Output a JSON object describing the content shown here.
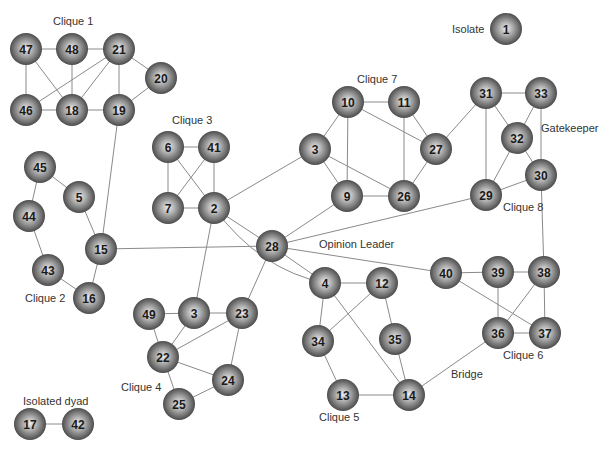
{
  "diagram": {
    "type": "social-network",
    "node_style": {
      "fill_light": "#e6e6e6",
      "fill_mid": "#8f8f8f",
      "fill_dark": "#3a3a3a",
      "edge_color": "#8a8a8a",
      "radius": 16
    },
    "nodes": [
      {
        "id": "47",
        "x": 26,
        "y": 49
      },
      {
        "id": "48",
        "x": 72,
        "y": 49
      },
      {
        "id": "21",
        "x": 119,
        "y": 49
      },
      {
        "id": "20",
        "x": 161,
        "y": 78
      },
      {
        "id": "46",
        "x": 26,
        "y": 110
      },
      {
        "id": "18",
        "x": 72,
        "y": 110
      },
      {
        "id": "19",
        "x": 119,
        "y": 110
      },
      {
        "id": "1",
        "x": 506,
        "y": 29
      },
      {
        "id": "10",
        "x": 348,
        "y": 102
      },
      {
        "id": "11",
        "x": 404,
        "y": 102
      },
      {
        "id": "3a",
        "label": "3",
        "x": 315,
        "y": 149
      },
      {
        "id": "27",
        "x": 436,
        "y": 149
      },
      {
        "id": "9",
        "x": 347,
        "y": 196
      },
      {
        "id": "26",
        "x": 404,
        "y": 196
      },
      {
        "id": "31",
        "x": 486,
        "y": 93
      },
      {
        "id": "33",
        "x": 541,
        "y": 93
      },
      {
        "id": "32",
        "x": 517,
        "y": 138
      },
      {
        "id": "30",
        "x": 541,
        "y": 175
      },
      {
        "id": "29",
        "x": 486,
        "y": 195
      },
      {
        "id": "6",
        "x": 168,
        "y": 147
      },
      {
        "id": "41",
        "x": 214,
        "y": 147
      },
      {
        "id": "7",
        "x": 168,
        "y": 208
      },
      {
        "id": "2",
        "x": 214,
        "y": 208
      },
      {
        "id": "45",
        "x": 40,
        "y": 167
      },
      {
        "id": "5",
        "x": 79,
        "y": 197
      },
      {
        "id": "44",
        "x": 29,
        "y": 216
      },
      {
        "id": "15",
        "x": 101,
        "y": 249
      },
      {
        "id": "43",
        "x": 48,
        "y": 270
      },
      {
        "id": "16",
        "x": 89,
        "y": 298
      },
      {
        "id": "28",
        "x": 272,
        "y": 246
      },
      {
        "id": "4",
        "x": 325,
        "y": 283
      },
      {
        "id": "12",
        "x": 382,
        "y": 283
      },
      {
        "id": "34",
        "x": 318,
        "y": 341
      },
      {
        "id": "35",
        "x": 395,
        "y": 339
      },
      {
        "id": "13",
        "x": 343,
        "y": 395
      },
      {
        "id": "14",
        "x": 409,
        "y": 395
      },
      {
        "id": "40",
        "x": 446,
        "y": 273
      },
      {
        "id": "39",
        "x": 498,
        "y": 272
      },
      {
        "id": "38",
        "x": 544,
        "y": 272
      },
      {
        "id": "36",
        "x": 498,
        "y": 333
      },
      {
        "id": "37",
        "x": 545,
        "y": 333
      },
      {
        "id": "49",
        "x": 149,
        "y": 314
      },
      {
        "id": "3b",
        "label": "3",
        "x": 194,
        "y": 313
      },
      {
        "id": "23",
        "x": 242,
        "y": 313
      },
      {
        "id": "22",
        "x": 163,
        "y": 357
      },
      {
        "id": "24",
        "x": 228,
        "y": 380
      },
      {
        "id": "25",
        "x": 179,
        "y": 404
      },
      {
        "id": "17",
        "x": 30,
        "y": 424
      },
      {
        "id": "42",
        "x": 78,
        "y": 424
      }
    ],
    "edges": [
      [
        "47",
        "48"
      ],
      [
        "48",
        "21"
      ],
      [
        "47",
        "46"
      ],
      [
        "47",
        "18"
      ],
      [
        "48",
        "18"
      ],
      [
        "21",
        "46"
      ],
      [
        "21",
        "18"
      ],
      [
        "21",
        "19"
      ],
      [
        "21",
        "20"
      ],
      [
        "20",
        "19"
      ],
      [
        "46",
        "18"
      ],
      [
        "18",
        "19"
      ],
      [
        "19",
        "15"
      ],
      [
        "10",
        "11"
      ],
      [
        "10",
        "3a"
      ],
      [
        "10",
        "9"
      ],
      [
        "10",
        "27"
      ],
      [
        "11",
        "27"
      ],
      [
        "11",
        "26"
      ],
      [
        "3a",
        "9"
      ],
      [
        "3a",
        "26"
      ],
      [
        "9",
        "26"
      ],
      [
        "26",
        "27"
      ],
      [
        "27",
        "31"
      ],
      [
        "31",
        "33"
      ],
      [
        "31",
        "32"
      ],
      [
        "31",
        "29"
      ],
      [
        "33",
        "32"
      ],
      [
        "33",
        "30"
      ],
      [
        "32",
        "29"
      ],
      [
        "32",
        "30"
      ],
      [
        "29",
        "30"
      ],
      [
        "6",
        "41"
      ],
      [
        "6",
        "7"
      ],
      [
        "6",
        "2"
      ],
      [
        "41",
        "7"
      ],
      [
        "41",
        "2"
      ],
      [
        "7",
        "2"
      ],
      [
        "2",
        "3a"
      ],
      [
        "2",
        "28"
      ],
      [
        "2",
        "3b"
      ],
      [
        "45",
        "5"
      ],
      [
        "45",
        "44"
      ],
      [
        "5",
        "15"
      ],
      [
        "44",
        "43"
      ],
      [
        "43",
        "16"
      ],
      [
        "15",
        "16"
      ],
      [
        "15",
        "28"
      ],
      [
        "28",
        "9"
      ],
      [
        "28",
        "29"
      ],
      [
        "28",
        "40"
      ],
      [
        "28",
        "4"
      ],
      [
        "28",
        "23"
      ],
      [
        "4",
        "12"
      ],
      [
        "4",
        "34"
      ],
      [
        "4",
        "14"
      ],
      [
        "12",
        "34"
      ],
      [
        "12",
        "35"
      ],
      [
        "34",
        "13"
      ],
      [
        "35",
        "14"
      ],
      [
        "13",
        "14"
      ],
      [
        "14",
        "36"
      ],
      [
        "40",
        "39"
      ],
      [
        "40",
        "37"
      ],
      [
        "39",
        "38"
      ],
      [
        "39",
        "36"
      ],
      [
        "38",
        "36"
      ],
      [
        "38",
        "37"
      ],
      [
        "36",
        "37"
      ],
      [
        "30",
        "38"
      ],
      [
        "49",
        "3b"
      ],
      [
        "3b",
        "23"
      ],
      [
        "49",
        "22"
      ],
      [
        "3b",
        "22"
      ],
      [
        "23",
        "22"
      ],
      [
        "23",
        "24"
      ],
      [
        "22",
        "24"
      ],
      [
        "22",
        "25"
      ],
      [
        "24",
        "25"
      ],
      [
        "17",
        "42"
      ]
    ],
    "curved_edges": [
      {
        "from": "2",
        "to": "4",
        "control": {
          "x": 260,
          "y": 270
        }
      }
    ],
    "annotations": [
      {
        "key": "clique1",
        "text": "Clique 1",
        "x": 53,
        "y": 25
      },
      {
        "key": "isolate",
        "text": "Isolate",
        "x": 452,
        "y": 33
      },
      {
        "key": "clique7",
        "text": "Clique 7",
        "x": 357,
        "y": 83
      },
      {
        "key": "clique3",
        "text": "Clique 3",
        "x": 172,
        "y": 124
      },
      {
        "key": "gatekeeper",
        "text": "Gatekeeper",
        "x": 541,
        "y": 132
      },
      {
        "key": "clique8",
        "text": "Clique 8",
        "x": 503,
        "y": 211
      },
      {
        "key": "opinion_leader",
        "text": "Opinion Leader",
        "x": 319,
        "y": 248
      },
      {
        "key": "clique2",
        "text": "Clique 2",
        "x": 25,
        "y": 302
      },
      {
        "key": "clique6",
        "text": "Clique 6",
        "x": 503,
        "y": 359
      },
      {
        "key": "clique4",
        "text": "Clique 4",
        "x": 121,
        "y": 391
      },
      {
        "key": "bridge",
        "text": "Bridge",
        "x": 451,
        "y": 378
      },
      {
        "key": "clique5",
        "text": "Clique 5",
        "x": 319,
        "y": 421
      },
      {
        "key": "isolated_dyad",
        "text": "Isolated dyad",
        "x": 23,
        "y": 405
      }
    ]
  }
}
